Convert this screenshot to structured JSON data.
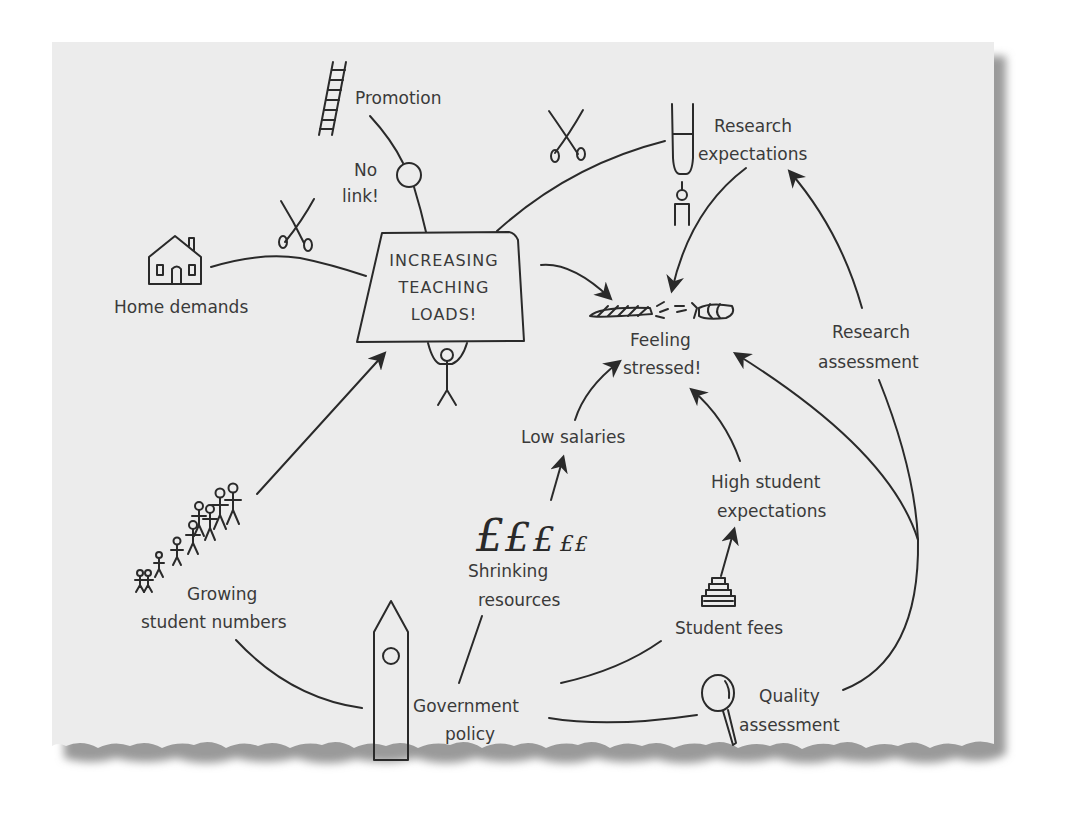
{
  "diagram": {
    "colors": {
      "paper": "#ececec",
      "ink": "#2a2a2a",
      "text": "#3a3a3a",
      "shadow": "#9a9a9a",
      "background": "#ffffff"
    },
    "center": {
      "line1": "INCREASING",
      "line2": "TEACHING",
      "line3": "LOADS!"
    },
    "nodes": {
      "promotion": "Promotion",
      "no_link_1": "No",
      "no_link_2": "link!",
      "research_expectations_1": "Research",
      "research_expectations_2": "expectations",
      "home_demands": "Home demands",
      "feeling_stressed_1": "Feeling",
      "feeling_stressed_2": "stressed!",
      "research_assessment_1": "Research",
      "research_assessment_2": "assessment",
      "low_salaries": "Low salaries",
      "high_student_expectations_1": "High student",
      "high_student_expectations_2": "expectations",
      "growing_student_numbers_1": "Growing",
      "growing_student_numbers_2": "student numbers",
      "shrinking_resources_1": "Shrinking",
      "shrinking_resources_2": "resources",
      "student_fees": "Student fees",
      "government_policy_1": "Government",
      "government_policy_2": "policy",
      "quality_assessment_1": "Quality",
      "quality_assessment_2": "assessment"
    },
    "icons": {
      "pound_big": "£",
      "pound_small": "£"
    }
  }
}
